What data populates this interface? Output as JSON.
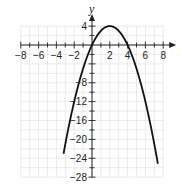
{
  "chart_data": {
    "type": "line",
    "title": "",
    "xlabel": "x",
    "ylabel": "y",
    "xlim": [
      -8,
      8
    ],
    "ylim": [
      -28,
      4
    ],
    "x_ticks": [
      -8,
      -6,
      -4,
      -2,
      2,
      4,
      6,
      8
    ],
    "y_ticks": [
      4,
      -8,
      -12,
      -16,
      -20,
      -24,
      -28
    ],
    "grid": true,
    "legend": null,
    "function": "y = -x^2 + 4x",
    "series": [
      {
        "name": "parabola",
        "x": [
          -2.9,
          -2,
          -1,
          0,
          1,
          2,
          3,
          4,
          5,
          6,
          7,
          7.3
        ],
        "y": [
          -20,
          -12,
          -5,
          0,
          3,
          4,
          3,
          0,
          -5,
          -12,
          -21,
          -24.1
        ]
      }
    ],
    "vertex": [
      2,
      4
    ],
    "x_intercepts": [
      0,
      4
    ]
  },
  "labels": {
    "x_axis": "x",
    "y_axis": "y",
    "x_ticks": [
      "−8",
      "−6",
      "−4",
      "−2",
      "2",
      "4",
      "6",
      "8"
    ],
    "y_ticks": [
      "4",
      "−8",
      "−12",
      "−16",
      "−20",
      "−24",
      "−28"
    ]
  }
}
